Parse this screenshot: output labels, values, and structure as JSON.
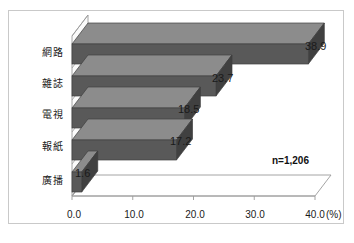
{
  "chart_data": {
    "type": "bar",
    "orientation": "horizontal",
    "title": "",
    "xlabel": "(%)",
    "ylabel": "",
    "categories": [
      "網路",
      "雜誌",
      "電視",
      "報紙",
      "廣播"
    ],
    "values": [
      38.9,
      23.7,
      18.5,
      17.2,
      1.6
    ],
    "value_labels": [
      "38.9",
      "23.7",
      "18.5",
      "17.2",
      "1.6"
    ],
    "xlim": [
      0,
      40
    ],
    "xticks": [
      0,
      10,
      20,
      30,
      40
    ],
    "xtick_labels": [
      "0.0",
      "10.0",
      "20.0",
      "30.0",
      "40.0"
    ],
    "grid": false,
    "legend": null,
    "annotations": [
      "n=1,206"
    ],
    "bar_color": "#595959",
    "bar_top_color": "#8c8c8c",
    "bar_side_color": "#404040",
    "axis_color": "#9a9a9a",
    "frame_color": "#c9c9c9",
    "style": "3d"
  },
  "axis": {
    "unit": "(%)",
    "tick_labels": [
      "0.0",
      "10.0",
      "20.0",
      "30.0",
      "40.0"
    ]
  },
  "annotation": {
    "sample_size": "n=1,206"
  }
}
